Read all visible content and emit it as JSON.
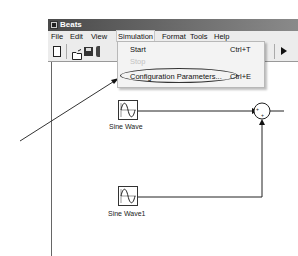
{
  "window": {
    "title": "Beats"
  },
  "menubar": {
    "items": [
      {
        "label": "File"
      },
      {
        "label": "Edit"
      },
      {
        "label": "View"
      },
      {
        "label": "Simulation"
      },
      {
        "label": "Format"
      },
      {
        "label": "Tools"
      },
      {
        "label": "Help"
      }
    ],
    "open_menu": "Simulation"
  },
  "toolbar": {
    "icons": [
      "new-file-icon",
      "open-folder-icon",
      "save-icon",
      "print-icon",
      "play-icon"
    ]
  },
  "simulation_menu": {
    "items": [
      {
        "label": "Start",
        "shortcut": "Ctrl+T",
        "enabled": true
      },
      {
        "label": "Stop",
        "shortcut": "",
        "enabled": false
      },
      {
        "label": "Configuration Parameters...",
        "shortcut": "Ctrl+E",
        "enabled": true,
        "highlighted": true
      }
    ]
  },
  "model": {
    "blocks": [
      {
        "type": "sine-wave",
        "label": "Sine Wave"
      },
      {
        "type": "sine-wave",
        "label": "Sine Wave1"
      },
      {
        "type": "sum",
        "signs": [
          "+",
          "+"
        ]
      }
    ]
  },
  "annotation": {
    "arrow_target": "Configuration Parameters..."
  }
}
